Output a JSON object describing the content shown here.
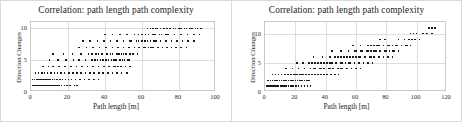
{
  "figure": {
    "background": "#ffffff",
    "point_color": "#1b1b1b",
    "grid_color": "#dedede",
    "frame_color": "#c8c8c8"
  },
  "panels": [
    {
      "name": "left-scatter-panel",
      "title": "Correlation: path length path complexity",
      "xlabel": "Path length [m]",
      "ylabel": "Direction Changes",
      "xticks": [
        "0",
        "20",
        "40",
        "60",
        "80",
        "100"
      ],
      "yticks": [
        "0",
        "5",
        "10"
      ]
    },
    {
      "name": "right-scatter-panel",
      "title": "Correlation: path length path complexity",
      "xlabel": "Path length [m]",
      "ylabel": "Direction Changes",
      "xticks": [
        "0",
        "20",
        "40",
        "60",
        "80",
        "100",
        "120"
      ],
      "yticks": [
        "0",
        "5",
        "10"
      ]
    }
  ],
  "chart_data": [
    {
      "type": "scatter",
      "title": "Correlation: path length path complexity",
      "xlabel": "Path length [m]",
      "ylabel": "Direction Changes",
      "xlim": [
        0,
        100
      ],
      "ylim": [
        0,
        11
      ],
      "xticks": [
        0,
        20,
        40,
        60,
        80,
        100
      ],
      "yticks": [
        0,
        5,
        10
      ],
      "grid": true,
      "legend": "none",
      "x": [
        1.2,
        1.8,
        2.4,
        3.0,
        3.6,
        4.2,
        4.8,
        5.6,
        6.4,
        7.2,
        8.4,
        9.6,
        11.0,
        12.5,
        1.0,
        1.6,
        2.2,
        2.9,
        3.5,
        4.1,
        4.9,
        5.5,
        6.2,
        6.9,
        7.6,
        8.3,
        9.1,
        9.8,
        10.6,
        11.4,
        12.2,
        13.1,
        14.0,
        15.2,
        16.5,
        18.0,
        19.4,
        21.0,
        23.5,
        25.0,
        0.8,
        2.0,
        3.2,
        4.4,
        5.2,
        6.0,
        7.0,
        8.0,
        9.2,
        10.4,
        11.6,
        12.8,
        14.2,
        15.6,
        17.0,
        18.6,
        20.2,
        22.0,
        24.0,
        26.5,
        29.0,
        31.5,
        34.0,
        36.5,
        2.5,
        4.0,
        5.8,
        7.4,
        9.0,
        10.8,
        12.6,
        14.4,
        16.2,
        18.2,
        20.4,
        22.6,
        24.8,
        27.0,
        29.4,
        31.8,
        34.2,
        36.6,
        39.0,
        41.5,
        44.0,
        46.5,
        49.0,
        52.0,
        6.5,
        9.5,
        12.0,
        15.0,
        18.5,
        21.5,
        24.5,
        27.5,
        30.5,
        33.5,
        36.5,
        39.5,
        42.5,
        45.5,
        48.5,
        51.0,
        53.5,
        42.0,
        44.5,
        47.0,
        10.0,
        14.5,
        19.0,
        23.0,
        26.0,
        29.5,
        33.0,
        36.0,
        39.0,
        42.0,
        45.0,
        48.0,
        50.5,
        53.0,
        34.5,
        37.5,
        40.5,
        43.5,
        46.0,
        49.5,
        52.5,
        12.0,
        17.5,
        22.5,
        27.0,
        31.0,
        35.0,
        38.5,
        41.0,
        44.0,
        47.5,
        50.0,
        53.5,
        55.0,
        57.5,
        33.0,
        36.5,
        43.0,
        46.5,
        49.0,
        51.5,
        26.0,
        30.0,
        33.5,
        37.0,
        40.5,
        44.0,
        47.0,
        50.0,
        53.0,
        56.0,
        58.5,
        61.0,
        63.5,
        66.0,
        68.5,
        71.0,
        73.5,
        76.0,
        78.5,
        81.0,
        84.0,
        62.0,
        65.0,
        69.0,
        28.0,
        32.0,
        36.0,
        39.5,
        43.0,
        46.5,
        50.0,
        53.5,
        57.0,
        60.0,
        63.0,
        66.5,
        70.0,
        73.0,
        76.0,
        79.0,
        82.0,
        85.0,
        88.0,
        54.0,
        58.0,
        61.5,
        64.5,
        67.5,
        40.0,
        44.0,
        48.0,
        52.0,
        56.0,
        60.0,
        63.5,
        67.0,
        70.5,
        74.0,
        77.5,
        81.0,
        84.5,
        88.0,
        91.0,
        58.0,
        62.0,
        66.0,
        69.5,
        73.0,
        63.0,
        66.0,
        68.0,
        72.0,
        75.0,
        78.0,
        81.0,
        84.0,
        87.0,
        90.0,
        64.5,
        67.5,
        70.0,
        73.5,
        77.0,
        80.0,
        83.0,
        86.0,
        89.0,
        92.0
      ],
      "y": [
        0,
        0,
        0,
        0,
        0,
        0,
        0,
        0,
        0,
        0,
        0,
        0,
        0,
        0,
        1,
        1,
        1,
        1,
        1,
        1,
        1,
        1,
        1,
        1,
        1,
        1,
        1,
        1,
        1,
        1,
        1,
        1,
        1,
        1,
        1,
        1,
        1,
        1,
        1,
        1,
        2,
        2,
        2,
        2,
        2,
        2,
        2,
        2,
        2,
        2,
        2,
        2,
        2,
        2,
        2,
        2,
        2,
        2,
        2,
        2,
        2,
        2,
        2,
        2,
        3,
        3,
        3,
        3,
        3,
        3,
        3,
        3,
        3,
        3,
        3,
        3,
        3,
        3,
        3,
        3,
        3,
        3,
        3,
        3,
        3,
        3,
        3,
        3,
        4,
        4,
        4,
        4,
        4,
        4,
        4,
        4,
        4,
        4,
        4,
        4,
        4,
        4,
        4,
        4,
        4,
        4,
        4,
        4,
        5,
        5,
        5,
        5,
        5,
        5,
        5,
        5,
        5,
        5,
        5,
        5,
        5,
        5,
        5,
        5,
        5,
        5,
        5,
        5,
        5,
        6,
        6,
        6,
        6,
        6,
        6,
        6,
        6,
        6,
        6,
        6,
        6,
        6,
        6,
        6,
        6,
        6,
        6,
        6,
        6,
        7,
        7,
        7,
        7,
        7,
        7,
        7,
        7,
        7,
        7,
        7,
        7,
        7,
        7,
        7,
        7,
        7,
        7,
        7,
        7,
        7,
        7,
        7,
        7,
        8,
        8,
        8,
        8,
        8,
        8,
        8,
        8,
        8,
        8,
        8,
        8,
        8,
        8,
        8,
        8,
        8,
        8,
        8,
        8,
        8,
        8,
        8,
        8,
        9,
        9,
        9,
        9,
        9,
        9,
        9,
        9,
        9,
        9,
        9,
        9,
        9,
        9,
        9,
        9,
        9,
        9,
        9,
        9,
        10,
        10,
        10,
        10,
        10,
        10,
        10,
        10,
        10,
        10,
        10,
        10,
        10,
        10,
        10,
        10,
        10,
        10,
        10,
        10
      ]
    },
    {
      "type": "scatter",
      "title": "Correlation: path length path complexity",
      "xlabel": "Path length [m]",
      "ylabel": "Direction Changes",
      "xlim": [
        0,
        120
      ],
      "ylim": [
        0,
        12
      ],
      "xticks": [
        0,
        20,
        40,
        60,
        80,
        100,
        120
      ],
      "yticks": [
        0,
        5,
        10
      ],
      "grid": true,
      "legend": "none",
      "x": [
        1.0,
        1.6,
        2.2,
        2.8,
        3.4,
        4.0,
        4.8,
        5.6,
        1.2,
        2.0,
        2.8,
        3.6,
        4.4,
        5.2,
        6.0,
        7.0,
        8.0,
        9.0,
        10.2,
        11.4,
        12.6,
        14.0,
        15.4,
        17.0,
        18.6,
        20.4,
        22.2,
        24.0,
        26.0,
        28.0,
        30.0,
        2.0,
        3.5,
        5.0,
        6.5,
        8.0,
        9.5,
        11.0,
        12.5,
        14.0,
        15.5,
        17.0,
        18.5,
        20.0,
        21.5,
        23.0,
        24.5,
        26.0,
        27.5,
        29.0,
        5.0,
        7.0,
        9.0,
        11.0,
        13.0,
        15.0,
        17.0,
        19.0,
        21.0,
        23.0,
        25.0,
        27.0,
        29.0,
        31.0,
        33.0,
        35.0,
        37.0,
        39.0,
        41.0,
        43.5,
        46.0,
        48.5,
        20.0,
        24.0,
        14.0,
        18.0,
        22.0,
        26.0,
        30.0,
        33.0,
        36.0,
        39.0,
        42.0,
        45.0,
        48.0,
        51.0,
        54.0,
        57.0,
        60.0,
        63.0,
        32.0,
        37.0,
        43.0,
        50.0,
        21.0,
        25.0,
        29.0,
        33.0,
        37.0,
        41.0,
        44.0,
        47.0,
        50.0,
        53.0,
        56.0,
        59.0,
        62.0,
        65.0,
        68.0,
        31.0,
        35.0,
        39.0,
        43.0,
        47.0,
        51.0,
        55.0,
        71.0,
        32.0,
        38.0,
        43.0,
        48.0,
        52.0,
        56.0,
        60.0,
        63.0,
        66.0,
        69.0,
        72.0,
        75.0,
        78.0,
        81.0,
        84.0,
        46.0,
        50.0,
        54.0,
        58.0,
        62.0,
        66.0,
        70.0,
        44.0,
        50.0,
        55.0,
        59.0,
        63.0,
        67.0,
        70.0,
        73.0,
        76.0,
        79.0,
        82.0,
        85.0,
        88.0,
        60.0,
        64.0,
        68.0,
        72.0,
        76.0,
        80.0,
        84.0,
        58.0,
        63.0,
        68.0,
        72.0,
        75.0,
        78.0,
        81.0,
        84.0,
        87.0,
        90.0,
        93.0,
        96.0,
        70.0,
        74.0,
        78.0,
        82.0,
        86.0,
        90.0,
        94.0,
        76.0,
        79.0,
        88.0,
        92.0,
        95.0,
        97.0,
        99.0,
        102.0,
        96.0,
        98.0,
        100.0,
        104.0,
        107.0,
        110.0,
        108.0,
        110.0,
        112.0
      ],
      "y": [
        0,
        0,
        0,
        0,
        0,
        0,
        0,
        0,
        1,
        1,
        1,
        1,
        1,
        1,
        1,
        1,
        1,
        1,
        1,
        1,
        1,
        1,
        1,
        1,
        1,
        1,
        1,
        1,
        1,
        1,
        1,
        2,
        2,
        2,
        2,
        2,
        2,
        2,
        2,
        2,
        2,
        2,
        2,
        2,
        2,
        2,
        2,
        2,
        2,
        2,
        3,
        3,
        3,
        3,
        3,
        3,
        3,
        3,
        3,
        3,
        3,
        3,
        3,
        3,
        3,
        3,
        3,
        3,
        3,
        3,
        3,
        3,
        3,
        3,
        4,
        4,
        4,
        4,
        4,
        4,
        4,
        4,
        4,
        4,
        4,
        4,
        4,
        4,
        4,
        4,
        4,
        4,
        4,
        4,
        5,
        5,
        5,
        5,
        5,
        5,
        5,
        5,
        5,
        5,
        5,
        5,
        5,
        5,
        5,
        5,
        5,
        5,
        5,
        5,
        5,
        5,
        5,
        6,
        6,
        6,
        6,
        6,
        6,
        6,
        6,
        6,
        6,
        6,
        6,
        6,
        6,
        6,
        6,
        6,
        6,
        6,
        6,
        6,
        6,
        7,
        7,
        7,
        7,
        7,
        7,
        7,
        7,
        7,
        7,
        7,
        7,
        7,
        7,
        7,
        7,
        7,
        7,
        7,
        7,
        8,
        8,
        8,
        8,
        8,
        8,
        8,
        8,
        8,
        8,
        8,
        8,
        8,
        8,
        8,
        8,
        8,
        8,
        8,
        9,
        9,
        9,
        9,
        9,
        9,
        9,
        9,
        10,
        10,
        10,
        10,
        10,
        10,
        11,
        11,
        11
      ]
    }
  ]
}
